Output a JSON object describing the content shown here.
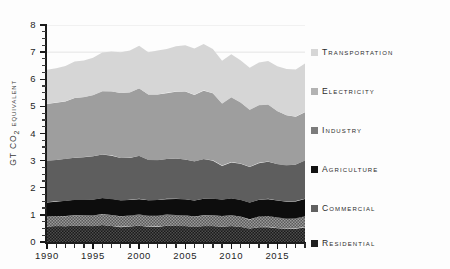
{
  "chart_data": {
    "type": "area",
    "title": "",
    "xlabel": "",
    "ylabel": "Gt CO2 equivalent",
    "ylabel_prefix": "Gt CO",
    "ylabel_sub": "2",
    "ylabel_suffix": " equivalent",
    "stacked": true,
    "grid": true,
    "legend_position": "right",
    "xlim": [
      1990,
      2018
    ],
    "ylim": [
      0,
      8
    ],
    "yticks": [
      0,
      1,
      2,
      3,
      4,
      5,
      6,
      7,
      8
    ],
    "ytick_labels": [
      "0",
      "1",
      "2",
      "3",
      "4",
      "5",
      "6",
      "7",
      "8"
    ],
    "yminor_step": 0.25,
    "xticks": [
      1990,
      1995,
      2000,
      2005,
      2010,
      2015
    ],
    "xtick_labels": [
      "1990",
      "1995",
      "2000",
      "2005",
      "2010",
      "2015"
    ],
    "xminor_step": 1,
    "gridlines_y": [
      7,
      8
    ],
    "x": [
      1990,
      1991,
      1992,
      1993,
      1994,
      1995,
      1996,
      1997,
      1998,
      1999,
      2000,
      2001,
      2002,
      2003,
      2004,
      2005,
      2006,
      2007,
      2008,
      2009,
      2010,
      2011,
      2012,
      2013,
      2014,
      2015,
      2016,
      2017,
      2018
    ],
    "series": [
      {
        "name": "Residential",
        "color": "#2b2b2b",
        "pattern": "checker-dark",
        "values": [
          0.56,
          0.58,
          0.58,
          0.6,
          0.59,
          0.58,
          0.62,
          0.59,
          0.56,
          0.58,
          0.6,
          0.57,
          0.57,
          0.6,
          0.59,
          0.58,
          0.55,
          0.58,
          0.58,
          0.56,
          0.58,
          0.55,
          0.49,
          0.55,
          0.56,
          0.52,
          0.5,
          0.51,
          0.55
        ]
      },
      {
        "name": "Commercial",
        "color": "#6e6e6e",
        "pattern": "checker-light",
        "values": [
          0.38,
          0.38,
          0.38,
          0.39,
          0.39,
          0.4,
          0.41,
          0.41,
          0.39,
          0.4,
          0.41,
          0.4,
          0.4,
          0.41,
          0.41,
          0.41,
          0.39,
          0.41,
          0.41,
          0.4,
          0.41,
          0.39,
          0.35,
          0.39,
          0.4,
          0.38,
          0.37,
          0.37,
          0.4
        ]
      },
      {
        "name": "Agriculture",
        "color": "#0d0d0d",
        "pattern": "solid",
        "values": [
          0.53,
          0.54,
          0.55,
          0.56,
          0.57,
          0.58,
          0.58,
          0.58,
          0.58,
          0.58,
          0.58,
          0.57,
          0.58,
          0.58,
          0.59,
          0.59,
          0.59,
          0.6,
          0.6,
          0.6,
          0.61,
          0.61,
          0.61,
          0.62,
          0.63,
          0.63,
          0.62,
          0.63,
          0.64
        ]
      },
      {
        "name": "Industry",
        "color": "#5e5e5e",
        "pattern": "solid",
        "values": [
          1.53,
          1.52,
          1.55,
          1.56,
          1.58,
          1.6,
          1.62,
          1.62,
          1.57,
          1.55,
          1.58,
          1.48,
          1.46,
          1.47,
          1.49,
          1.46,
          1.44,
          1.46,
          1.42,
          1.26,
          1.35,
          1.34,
          1.32,
          1.36,
          1.38,
          1.34,
          1.33,
          1.35,
          1.41
        ]
      },
      {
        "name": "Electricity",
        "color": "#9e9e9e",
        "pattern": "solid",
        "values": [
          2.1,
          2.12,
          2.13,
          2.2,
          2.21,
          2.25,
          2.32,
          2.35,
          2.39,
          2.4,
          2.49,
          2.42,
          2.43,
          2.44,
          2.47,
          2.52,
          2.46,
          2.54,
          2.47,
          2.28,
          2.38,
          2.25,
          2.1,
          2.12,
          2.09,
          1.95,
          1.85,
          1.77,
          1.79
        ]
      },
      {
        "name": "Transportation",
        "color": "#d6d6d6",
        "pattern": "solid",
        "values": [
          1.25,
          1.26,
          1.3,
          1.33,
          1.37,
          1.4,
          1.44,
          1.47,
          1.51,
          1.55,
          1.58,
          1.56,
          1.6,
          1.61,
          1.66,
          1.68,
          1.69,
          1.7,
          1.63,
          1.58,
          1.59,
          1.57,
          1.56,
          1.58,
          1.62,
          1.66,
          1.7,
          1.73,
          1.77
        ]
      }
    ]
  },
  "legend": {
    "items": [
      {
        "label": "Transportation",
        "color": "#d6d6d6",
        "top": 19
      },
      {
        "label": "Electricity",
        "color": "#b3b3b3",
        "top": 58
      },
      {
        "label": "Industry",
        "color": "#7c7c7c",
        "top": 97
      },
      {
        "label": "Agriculture",
        "color": "#121212",
        "top": 136
      },
      {
        "label": "Commercial",
        "color": "#616161",
        "top": 175
      },
      {
        "label": "Residential",
        "color": "#1f1f1f",
        "top": 210
      }
    ]
  },
  "axes": {
    "y_title_prefix": "Gt CO",
    "y_title_sub": "2",
    "y_title_suffix": " equivalent"
  }
}
